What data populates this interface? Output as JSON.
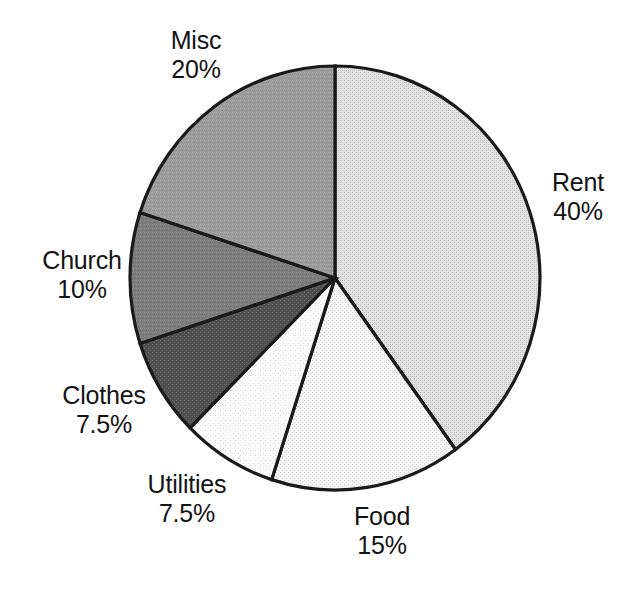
{
  "chart_data": {
    "type": "pie",
    "title": "",
    "subtitle": "",
    "xlabel": "",
    "ylabel": "",
    "legend_position": "none",
    "grid": false,
    "labels_outside": true,
    "start_angle_deg": 0,
    "direction": "clockwise",
    "categories": [
      "Rent",
      "Food",
      "Utilities",
      "Clothes",
      "Church",
      "Misc"
    ],
    "values": [
      40,
      15,
      7.5,
      7.5,
      10,
      20
    ],
    "value_unit": "%",
    "slices": [
      {
        "name": "Rent",
        "value": 40,
        "value_label": "40%",
        "start_deg": 0,
        "end_deg": 144,
        "fill": "#d9d9d9",
        "pattern": "fine-dither-light"
      },
      {
        "name": "Food",
        "value": 15,
        "value_label": "15%",
        "start_deg": 144,
        "end_deg": 198,
        "fill": "#ededed",
        "pattern": "fine-dither-very-light"
      },
      {
        "name": "Utilities",
        "value": 7.5,
        "value_label": "7.5%",
        "start_deg": 198,
        "end_deg": 225,
        "fill": "#f7f7f7",
        "pattern": "sparse-dots"
      },
      {
        "name": "Clothes",
        "value": 7.5,
        "value_label": "7.5%",
        "start_deg": 225,
        "end_deg": 252,
        "fill": "#565656",
        "pattern": "dark-dither"
      },
      {
        "name": "Church",
        "value": 10,
        "value_label": "10%",
        "start_deg": 252,
        "end_deg": 288,
        "fill": "#7f7f7f",
        "pattern": "mid-dark-dither"
      },
      {
        "name": "Misc",
        "value": 20,
        "value_label": "20%",
        "start_deg": 288,
        "end_deg": 360,
        "fill": "#9b9b9b",
        "pattern": "mid-dither"
      }
    ],
    "outline_color": "#1a1a1a",
    "background_color": "#ffffff",
    "text_color": "#131313"
  },
  "labels": {
    "misc": {
      "name": "Misc",
      "value": "20%"
    },
    "rent": {
      "name": "Rent",
      "value": "40%"
    },
    "church": {
      "name": "Church",
      "value": "10%"
    },
    "clothes": {
      "name": "Clothes",
      "value": "7.5%"
    },
    "utilities": {
      "name": "Utilities",
      "value": "7.5%"
    },
    "food": {
      "name": "Food",
      "value": "15%"
    }
  }
}
